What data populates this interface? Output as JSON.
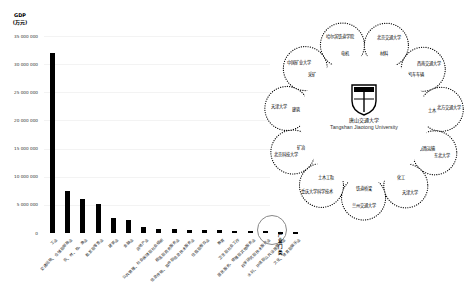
{
  "chart_data": {
    "type": "bar",
    "title": "",
    "ylabel": "GDP (万元)",
    "ylabel_lines": [
      "GDP",
      "(万元)"
    ],
    "xlabel": "产业门类",
    "ylim": [
      0,
      35000000
    ],
    "yticks": [
      "0",
      "5 000 000",
      "10 000 000",
      "15 000 000",
      "20 000 000",
      "25 000 000",
      "30 000 000",
      "35 000 000"
    ],
    "grid": true,
    "categories": [
      "工业",
      "交通运输、仓储和邮政业",
      "农、林、牧、渔业",
      "批发和零售业",
      "建筑业",
      "金融业",
      "房地产业",
      "公共管理、社会保障和社会组织",
      "租赁和商务服务业",
      "信息传输、软件和信息技术服务业",
      "住宿和餐饮业",
      "教育",
      "卫生和社会工作",
      "居民服务、修理和其他服务业",
      "科学研究和技术服务业",
      "水利、环境和公共设施管理业",
      "文化、体育和娱乐业"
    ],
    "values": [
      32000000,
      7500000,
      6100000,
      5200000,
      2600000,
      2300000,
      1100000,
      700000,
      650000,
      550000,
      500000,
      450000,
      420000,
      380000,
      330000,
      120000,
      60000
    ],
    "annotations": [
      "circle highlight around 科学研究和技术服务业 / 水利 bars"
    ]
  },
  "diagram": {
    "center": {
      "name_cn": "唐山交通大学",
      "name_en": "Tangshan Jiaotong University",
      "logo": "university-crest-icon"
    },
    "nodes": [
      {
        "outer": "哈尔滨铁道学院",
        "inner": "电机"
      },
      {
        "outer": "北京交通大学",
        "inner": "材料"
      },
      {
        "outer": "西南交通大学",
        "inner": "机车车辆"
      },
      {
        "outer": "北方交通大学",
        "inner": "土木"
      },
      {
        "outer": "东北大学",
        "inner": "铁路运输"
      },
      {
        "outer": "天津大学",
        "inner": "化工"
      },
      {
        "outer": "兰州交通大学",
        "inner": "铁道桥梁"
      },
      {
        "outer": "重庆大学科学技术",
        "inner": "土木工程"
      },
      {
        "outer": "北京科技大学",
        "inner": "矿冶"
      },
      {
        "outer": "天津大学",
        "inner": "建筑"
      },
      {
        "outer": "中国矿业大学",
        "inner": "采矿"
      }
    ]
  }
}
